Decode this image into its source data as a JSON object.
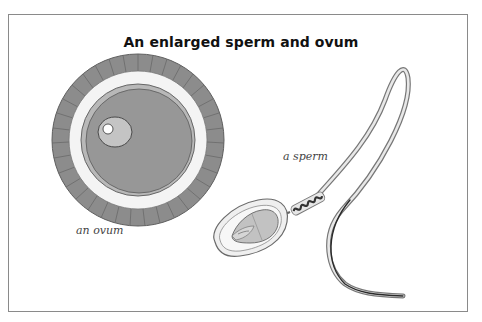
{
  "title": "An enlarged sperm and ovum",
  "labels": {
    "ovum": "an ovum",
    "sperm": "a sperm"
  },
  "colors": {
    "frame_border": "#8a8a8a",
    "corona_cells": "#8c8c8c",
    "zona": "#f4f4f4",
    "cytoplasm": "#9a9a9a",
    "nucleus": "#c4c4c4",
    "nucleolus": "#ffffff",
    "outline": "#555555"
  }
}
